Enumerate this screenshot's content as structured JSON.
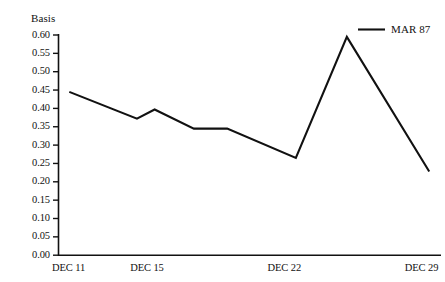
{
  "chart_data": {
    "type": "line",
    "title": "",
    "ylabel": "Basis",
    "xlabel": "",
    "ylim": [
      0.0,
      0.6
    ],
    "grid": false,
    "legend_position": "top-right",
    "yticks": [
      "0.00",
      "0.05",
      "0.10",
      "0.15",
      "0.20",
      "0.25",
      "0.30",
      "0.35",
      "0.40",
      "0.45",
      "0.50",
      "0.55",
      "0.60"
    ],
    "ytick_values": [
      0.0,
      0.05,
      0.1,
      0.15,
      0.2,
      0.25,
      0.3,
      0.35,
      0.4,
      0.45,
      0.5,
      0.55,
      0.6
    ],
    "xtick_labels": [
      "DEC 11",
      "DEC 15",
      "DEC 22",
      "DEC 29"
    ],
    "xtick_positions": [
      0,
      4,
      11,
      18
    ],
    "xlim": [
      0,
      19.5
    ],
    "series": [
      {
        "name": "MAR 87",
        "color": "#111111",
        "x": [
          0.55,
          4.0,
          4.9,
          6.9,
          8.6,
          12.1,
          14.7,
          18.9
        ],
        "values": [
          0.445,
          0.372,
          0.397,
          0.345,
          0.345,
          0.265,
          0.595,
          0.228
        ]
      }
    ]
  },
  "legend": {
    "entries": [
      {
        "label": "MAR 87",
        "color": "#111111"
      }
    ]
  },
  "axes": {
    "y_title": "Basis"
  }
}
